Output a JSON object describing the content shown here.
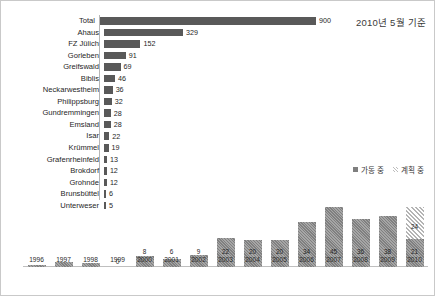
{
  "annotation": {
    "as_of": "2010년 5월 기준"
  },
  "legend": {
    "operating_label": "가동 중",
    "planned_label": "계획 중",
    "operating_color": "#7f7f7f",
    "planned_color": "#d9d9d9"
  },
  "chart_data": [
    {
      "type": "bar",
      "orientation": "horizontal",
      "title": "2010년 5월 기준",
      "xlabel": "",
      "ylabel": "",
      "grid": false,
      "xlim": [
        0,
        900
      ],
      "categories": [
        "Total",
        "Ahaus",
        "FZ Jülich",
        "Gorleben",
        "Greifswald",
        "Biblis",
        "Neckarwestheim",
        "Philippsburg",
        "Gundremmingen",
        "Emsland",
        "Isar",
        "Krümmel",
        "Grafenrheinfeld",
        "Brokdorf",
        "Grohnde",
        "Brunsbüttel",
        "Unterweser"
      ],
      "values": [
        900,
        329,
        152,
        91,
        69,
        46,
        36,
        32,
        28,
        28,
        22,
        19,
        13,
        12,
        12,
        6,
        5
      ],
      "bar_color": "#595959"
    },
    {
      "type": "bar",
      "orientation": "vertical",
      "stacked": true,
      "title": "",
      "xlabel": "",
      "ylabel": "",
      "grid": false,
      "ylim": [
        0,
        45
      ],
      "categories": [
        "1996",
        "1997",
        "1998",
        "1999",
        "2000",
        "2001",
        "2002",
        "2003",
        "2004",
        "2005",
        "2006",
        "2007",
        "2008",
        "2009",
        "2010"
      ],
      "series": [
        {
          "name": "가동 중",
          "values": [
            1,
            4,
            3,
            0,
            8,
            6,
            9,
            22,
            20,
            20,
            34,
            45,
            36,
            38,
            21
          ],
          "labels": [
            "",
            "",
            "",
            "0",
            "8",
            "6",
            "9",
            "22",
            "20",
            "20",
            "34",
            "45",
            "36",
            "38",
            "21"
          ]
        },
        {
          "name": "계획 중",
          "values": [
            0,
            0,
            0,
            0,
            0,
            0,
            0,
            0,
            0,
            0,
            0,
            0,
            0,
            0,
            24
          ],
          "labels": [
            "",
            "",
            "",
            "",
            "",
            "",
            "",
            "",
            "",
            "",
            "",
            "",
            "",
            "",
            "24"
          ]
        }
      ]
    }
  ]
}
